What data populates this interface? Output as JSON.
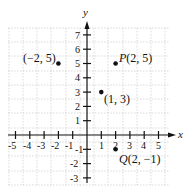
{
  "diagram": {
    "type": "coordinate-plane",
    "axes": {
      "x_label": "x",
      "y_label": "y",
      "x_ticks": [
        "-5",
        "-4",
        "-3",
        "-2",
        "-1",
        "1",
        "2",
        "3",
        "4",
        "5"
      ],
      "y_ticks": [
        "7",
        "6",
        "5",
        "4",
        "3",
        "2",
        "1",
        "-1",
        "-2",
        "-3"
      ],
      "x_range": [
        -5,
        5
      ],
      "y_range": [
        -3,
        7
      ]
    },
    "points": [
      {
        "label": "(−2, 5)",
        "x": -2,
        "y": 5
      },
      {
        "label": "P(2, 5)",
        "x": 2,
        "y": 5
      },
      {
        "label": "(1, 3)",
        "x": 1,
        "y": 3
      },
      {
        "label": "Q(2, −1)",
        "x": 2,
        "y": -1
      }
    ],
    "colors": {
      "grid": "#c8c8c8",
      "axis": "#111111",
      "point": "#111111"
    }
  }
}
